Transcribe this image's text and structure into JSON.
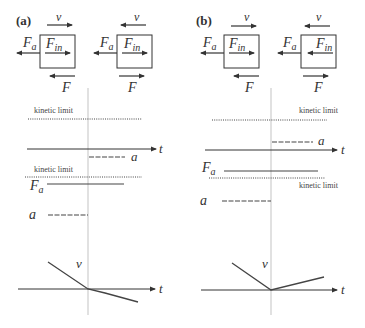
{
  "figure": {
    "panels": [
      {
        "id": "a",
        "label": "(a)",
        "boxes": [
          {
            "v_label": "v",
            "v_dir": "right",
            "fa_label": "F",
            "fa_sub": "a",
            "fin_label": "F",
            "fin_sub": "in",
            "fin_dir": "right",
            "f_label": "F",
            "f_dir": "left"
          },
          {
            "v_label": "v",
            "v_dir": "left",
            "fa_label": "F",
            "fa_sub": "a",
            "fin_label": "F",
            "fin_sub": "in",
            "fin_dir": "right",
            "f_label": "F",
            "f_dir": "right"
          }
        ],
        "upper_plot": {
          "kinetic_label": "kinetic limit",
          "t_label": "t",
          "a_label": "a"
        },
        "lower_plot": {
          "kinetic_label": "kinetic limit",
          "fa_label": "F",
          "fa_sub": "a",
          "a_label": "a"
        },
        "velocity_plot": {
          "v_label": "v",
          "t_label": "t"
        }
      },
      {
        "id": "b",
        "label": "(b)",
        "boxes": [
          {
            "v_label": "v",
            "v_dir": "right",
            "fa_label": "F",
            "fa_sub": "a",
            "fin_label": "F",
            "fin_sub": "in",
            "fin_dir": "right",
            "f_label": "F",
            "f_dir": "left"
          },
          {
            "v_label": "v",
            "v_dir": "left",
            "fa_label": "F",
            "fa_sub": "a",
            "fin_label": "F",
            "fin_sub": "in",
            "fin_dir": "left",
            "f_label": "F",
            "f_dir": "right"
          }
        ],
        "upper_plot": {
          "kinetic_label": "kinetic limit",
          "t_label": "t",
          "a_label": "a"
        },
        "lower_plot": {
          "kinetic_label": "kinetic limit",
          "fa_label": "F",
          "fa_sub": "a",
          "a_label": "a"
        },
        "velocity_plot": {
          "v_label": "v",
          "t_label": "t"
        }
      }
    ]
  }
}
